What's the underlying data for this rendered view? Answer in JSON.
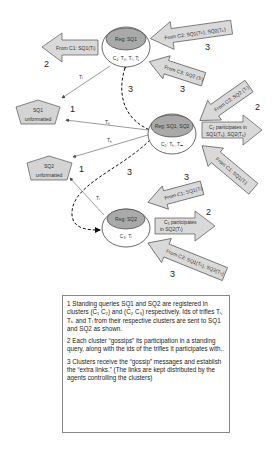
{
  "diagram": {
    "nodes": {
      "c1": {
        "reg": "Reg: SQ1",
        "members": "C₁: T₀, Tᵢ, Tⱼ"
      },
      "c2": {
        "reg": "Reg: SQ1, SQ2",
        "members": "C₂: Tₖ, Tₘ"
      },
      "c3": {
        "reg": "Reg: SQ2",
        "members": "C₃: Tₗ"
      },
      "sq1": {
        "name": "SQ1",
        "state": "unformatted"
      },
      "sq2": {
        "name": "SQ2",
        "state": "unformatted"
      }
    },
    "edge_labels": {
      "c1_to_sq1": "Tᵢ",
      "c2_to_sq1": "Tₖ",
      "c2_to_sq2": "Tₖ",
      "c3_to_sq2": "Tₗ"
    },
    "arrows": {
      "c1_out": "From C1: SQ1(Tᵢ)",
      "c1_in_from_c2": "From C2: SQ1(Tₖ), SQ2(Tₖ)",
      "c1_in_from_c3": "From C3: SQ2 (Tₗ)",
      "c2_in_from_c3": "From C3: SQ2 (Tₗ)",
      "c2_out_line1": "C₂ participates in",
      "c2_out_line2": "SQ1(Tₖ), SQ2(Tₖ)",
      "c2_in_from_c1": "From C1: SQ1(Tᵢ)",
      "c3_in_from_c1": "From C1: SQ1(Tᵢ)",
      "c3_out_line1": "C₃ participates",
      "c3_out_line2": "in SQ2(Tₗ)",
      "c3_in_from_c2": "From C2: SQ1(Tₖ), SQ2(Tₖ)"
    },
    "step_numbers": {
      "one": "1",
      "two": "2",
      "three": "3"
    }
  },
  "legend": {
    "step1": "1 Standing queries SQ1 and SQ2 are registered in clusters (C₁ C₂) and (C₂ C₃) respectively. Ids of trifles Tᵢ, Tₖ and Tₗ from their respective clusters are sent to SQ1 and SQ2 as shown.",
    "step2": "2  Each cluster “gossips” its participation in a standing query, along with the ids of the trifles it participates with..",
    "step3": "3  Clusters receive the “gossip” messages and establish the “extra links.” (The links are kept distributed by the agents controlling the clusters)"
  },
  "colors": {
    "arrow_fill": "#d9d9d9",
    "reg_fill": "#a9a9a9",
    "pentagon_fill": "#d4d4d4",
    "stroke": "#555555"
  }
}
